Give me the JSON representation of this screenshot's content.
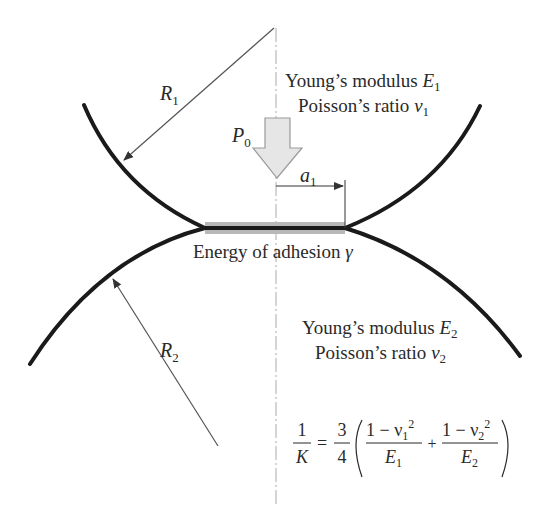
{
  "diagram": {
    "top_body": {
      "radius_label": "R",
      "radius_sub": "1",
      "modulus_text": "Young’s modulus ",
      "modulus_sym": "E",
      "modulus_sub": "1",
      "poisson_text": "Poisson’s ratio ",
      "poisson_sym": "ν",
      "poisson_sub": "1"
    },
    "bottom_body": {
      "radius_label": "R",
      "radius_sub": "2",
      "modulus_text": "Young’s modulus ",
      "modulus_sym": "E",
      "modulus_sub": "2",
      "poisson_text": "Poisson’s ratio ",
      "poisson_sym": "ν",
      "poisson_sub": "2"
    },
    "load": {
      "sym": "P",
      "sub": "0"
    },
    "contact_radius": {
      "sym": "a",
      "sub": "1"
    },
    "adhesion": {
      "text": "Energy of adhesion ",
      "sym": "γ"
    },
    "equation": {
      "lhs_num": "1",
      "lhs_den": "K",
      "equals": "=",
      "coef_num": "3",
      "coef_den": "4",
      "term1_num": "1 − ν",
      "term1_num_sub": "1",
      "term1_num_sup": "2",
      "term1_den": "E",
      "term1_den_sub": "1",
      "plus": "+",
      "term2_num": "1 − ν",
      "term2_num_sub": "2",
      "term2_num_sup": "2",
      "term2_den": "E",
      "term2_den_sub": "2"
    },
    "colors": {
      "curve": "#1a1a1a",
      "arrow_fill": "#e6e6e6",
      "arrow_stroke": "#9a9a9a",
      "contact_band": "#b8b8b8",
      "centerline": "#aaaaaa",
      "leader": "#555555"
    }
  }
}
